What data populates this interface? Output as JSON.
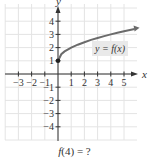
{
  "chart_data": {
    "type": "line",
    "title": "",
    "xlabel": "x",
    "ylabel": "y",
    "xlim": [
      -4,
      6
    ],
    "ylim": [
      -5,
      5
    ],
    "grid": true,
    "x_ticks": [
      -3,
      -2,
      -1,
      1,
      2,
      3,
      4,
      5
    ],
    "y_ticks": [
      -4,
      -3,
      -2,
      -1,
      1,
      2,
      3,
      4
    ],
    "x_tick_labels": [
      "−3",
      "−2",
      "−1",
      "1",
      "2",
      "3",
      "4",
      "5"
    ],
    "y_tick_labels": [
      "−4",
      "−3",
      "−2",
      "−1",
      "1",
      "2",
      "3",
      "4"
    ],
    "series": [
      {
        "name": "y = f(x)",
        "label": "y = f(x)",
        "start_point": {
          "x": 0,
          "y": 1,
          "filled": true
        },
        "end_arrow": true,
        "x": [
          0,
          0.25,
          0.5,
          1,
          1.5,
          2,
          2.5,
          3,
          3.5,
          4,
          4.5,
          5,
          5.8
        ],
        "y": [
          1,
          1.5,
          1.71,
          2,
          2.22,
          2.41,
          2.58,
          2.73,
          2.87,
          3,
          3.12,
          3.24,
          3.41
        ]
      }
    ],
    "colors": {
      "curve": "#6b6b6b",
      "axis": "#333333",
      "grid": "#e4e4e4",
      "label_box": "#e9e9e9"
    }
  },
  "question": {
    "fn": "f",
    "arg": "(4)",
    "rest": " = ?"
  }
}
